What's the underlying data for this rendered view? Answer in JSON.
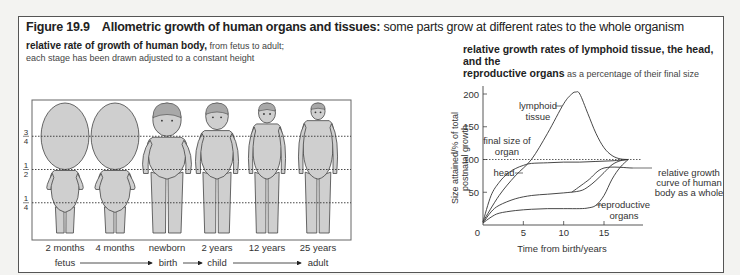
{
  "figure": {
    "number": "Figure 19.9",
    "title_bold": "Allometric growth of human organs and tissues:",
    "title_rest": " some parts grow at different rates to the whole organism"
  },
  "left_panel": {
    "heading_bold": "relative rate of growth of human body,",
    "heading_rest": " from fetus to adult;",
    "heading_line2": "each stage has been drawn adjusted to a constant height",
    "fraction_marks": [
      {
        "num": "3",
        "den": "4",
        "value": 0.75
      },
      {
        "num": "1",
        "den": "2",
        "value": 0.5
      },
      {
        "num": "1",
        "den": "4",
        "value": 0.25
      }
    ],
    "stages": [
      {
        "label": "2 months",
        "type": "fetus2"
      },
      {
        "label": "4 months",
        "type": "fetus4"
      },
      {
        "label": "newborn",
        "type": "newborn"
      },
      {
        "label": "2 years",
        "type": "child2"
      },
      {
        "label": "12 years",
        "type": "child12"
      },
      {
        "label": "25 years",
        "type": "adult"
      }
    ],
    "timeline": [
      {
        "label": "fetus"
      },
      {
        "label": "birth"
      },
      {
        "label": "child"
      },
      {
        "label": "adult"
      }
    ]
  },
  "right_panel": {
    "heading_bold_1": "relative growth rates of lymphoid tissue, the head, and the",
    "heading_bold_2": "reproductive organs",
    "heading_rest": " as a percentage of their final size"
  },
  "chart_data": {
    "type": "line",
    "title": "relative growth rates of lymphoid tissue, the head, and the reproductive organs as a percentage of their final size",
    "xlabel": "Time from birth/years",
    "ylabel": "Size attained/% of total postnatal growth",
    "xlim": [
      0,
      18.5
    ],
    "ylim": [
      0,
      220
    ],
    "xticks": [
      0,
      5,
      10,
      15
    ],
    "yticks": [
      50,
      100,
      150,
      200
    ],
    "reference_line": {
      "y": 100,
      "label": "final size of organ",
      "style": "dotted"
    },
    "series": [
      {
        "name": "lymphoid tissue",
        "x": [
          0,
          2,
          4,
          6,
          8,
          10,
          11,
          11.5,
          12,
          13,
          14,
          15,
          16,
          17,
          18
        ],
        "y": [
          5,
          45,
          75,
          100,
          140,
          185,
          200,
          203,
          200,
          170,
          140,
          118,
          106,
          101,
          100
        ]
      },
      {
        "name": "head",
        "x": [
          0,
          1,
          2,
          3,
          4,
          5,
          6,
          8,
          10,
          12,
          14,
          16,
          18
        ],
        "y": [
          5,
          45,
          65,
          78,
          86,
          91,
          94,
          95,
          96,
          96,
          97,
          98,
          100
        ]
      },
      {
        "name": "relative growth curve of human body as a whole",
        "x": [
          0,
          1,
          2,
          4,
          6,
          8,
          10,
          12,
          13,
          14,
          15,
          16,
          17,
          18
        ],
        "y": [
          3,
          20,
          30,
          40,
          45,
          47,
          49,
          52,
          58,
          68,
          80,
          92,
          98,
          100
        ]
      },
      {
        "name": "reproductive organs",
        "x": [
          0,
          1,
          2,
          4,
          6,
          8,
          10,
          12,
          13,
          14,
          15,
          16,
          17,
          18
        ],
        "y": [
          3,
          12,
          18,
          22,
          24,
          25,
          25,
          25,
          26,
          30,
          45,
          70,
          88,
          100
        ]
      },
      {
        "name": "plateau",
        "x": [
          11,
          13,
          15,
          18.5
        ],
        "y": [
          50,
          68,
          87,
          87
        ]
      }
    ],
    "annotations": [
      {
        "text": "lymphoid",
        "text2": "tissue",
        "series": "lymphoid tissue"
      },
      {
        "text": "final size of",
        "text2": "organ"
      },
      {
        "text": "head",
        "series": "head"
      },
      {
        "text": "relative growth",
        "text2": "curve of human",
        "text3": "body as a whole"
      },
      {
        "text": "reproductive",
        "text2": "organs"
      }
    ],
    "ylabel_line1": "Size attained/% of total",
    "ylabel_line2": "postnatal growth"
  }
}
